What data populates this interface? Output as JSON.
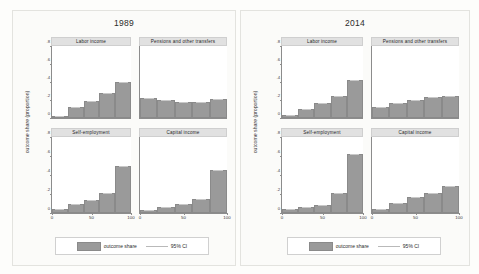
{
  "chart_data": {
    "type": "bar",
    "xlabel": "",
    "ylabel": "outcome share (proportion)",
    "ylim": [
      0,
      0.8
    ],
    "yticks": [
      0,
      0.2,
      0.4,
      0.6,
      0.8
    ],
    "ytick_labels": [
      "0",
      ".2",
      ".4",
      ".6",
      ".8"
    ],
    "xlim": [
      0,
      100
    ],
    "xticks": [
      0,
      50,
      100
    ],
    "xtick_labels": [
      "0",
      "50",
      "100"
    ],
    "grid": false,
    "legend_position": "bottom",
    "legend": [
      "outcome share",
      "95% CI"
    ],
    "categories": [
      "0-20",
      "20-40",
      "40-60",
      "60-80",
      "80-100"
    ],
    "panels": [
      {
        "year": "1989",
        "facets": [
          {
            "name": "Labor income",
            "values": [
              0.02,
              0.12,
              0.19,
              0.28,
              0.4
            ]
          },
          {
            "name": "Pensions and other transfers",
            "values": [
              0.22,
              0.2,
              0.18,
              0.18,
              0.21
            ]
          },
          {
            "name": "Self-employment",
            "values": [
              0.04,
              0.09,
              0.14,
              0.21,
              0.5
            ]
          },
          {
            "name": "Capital income",
            "values": [
              0.03,
              0.06,
              0.1,
              0.15,
              0.45
            ]
          }
        ]
      },
      {
        "year": "2014",
        "facets": [
          {
            "name": "Labor income",
            "values": [
              0.03,
              0.1,
              0.17,
              0.25,
              0.42
            ]
          },
          {
            "name": "Pensions and other transfers",
            "values": [
              0.12,
              0.17,
              0.2,
              0.23,
              0.25
            ]
          },
          {
            "name": "Self-employment",
            "values": [
              0.04,
              0.06,
              0.08,
              0.21,
              0.62
            ]
          },
          {
            "name": "Capital income",
            "values": [
              0.04,
              0.11,
              0.17,
              0.21,
              0.28
            ]
          }
        ]
      }
    ]
  },
  "left_panel": {
    "title": "1989",
    "ylabel": "outcome share (proportion)",
    "legend": {
      "bar_label": "outcome share",
      "ci_label": "95% CI"
    }
  },
  "right_panel": {
    "title": "2014",
    "ylabel": "outcome share (proportion)",
    "legend": {
      "bar_label": "outcome share",
      "ci_label": "95% CI"
    }
  }
}
